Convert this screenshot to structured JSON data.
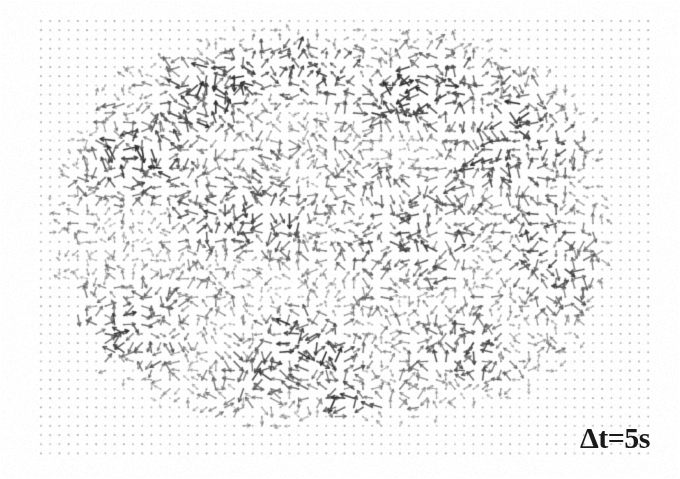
{
  "figure": {
    "kind": "piv-vector-field",
    "width": 680,
    "height": 479,
    "background_color": "#ffffff",
    "title": "",
    "caption": ""
  },
  "annotations": {
    "delta_t_label": "Δt=5s"
  },
  "chart_data": {
    "type": "scatter",
    "subtype": "quiver-vector-field",
    "title": "",
    "subtitle": "",
    "xlabel": "",
    "ylabel": "",
    "legend": [],
    "grid": true,
    "annotations": [
      {
        "text": "Δt=5s",
        "x": 605,
        "y": 438,
        "align": "right",
        "font_size": 30,
        "bold": true
      }
    ],
    "node_grid": {
      "x_start": 41,
      "y_start": 21,
      "spacing": 9.2,
      "cols": 67,
      "rows": 48,
      "node_color": "#8c8c8c",
      "node_size": 1.7
    },
    "vector_region": {
      "shape": "rounded-blob",
      "center_x": 332,
      "center_y": 226,
      "radius_x": 272,
      "radius_y": 196,
      "superellipse_exponent": 2.6,
      "edge_softness": 0.16
    },
    "vectors": {
      "arrow_color_dark": "#2e2e2e",
      "arrow_color_mid": "#6b6b6b",
      "arrow_color_light": "#aaaaaa",
      "min_length": 3.5,
      "max_length": 16,
      "head_size": 2.6,
      "line_width": 1.15,
      "coherence_scale": 52,
      "noise_seed": 20250411,
      "density": 1.0,
      "description": "Short velocity vectors emanating from each interior grid node, locally correlated in direction with strong small-scale disorder; intensity varies with local magnitude."
    },
    "intensity_patches": [
      {
        "cx": 290,
        "cy": 72,
        "rx": 120,
        "ry": 42,
        "weight": 0.95
      },
      {
        "cx": 432,
        "cy": 95,
        "rx": 110,
        "ry": 50,
        "weight": 0.92
      },
      {
        "cx": 520,
        "cy": 140,
        "rx": 85,
        "ry": 60,
        "weight": 0.85
      },
      {
        "cx": 150,
        "cy": 170,
        "rx": 75,
        "ry": 60,
        "weight": 0.8
      },
      {
        "cx": 240,
        "cy": 215,
        "rx": 90,
        "ry": 55,
        "weight": 0.72
      },
      {
        "cx": 400,
        "cy": 230,
        "rx": 100,
        "ry": 70,
        "weight": 0.6
      },
      {
        "cx": 545,
        "cy": 255,
        "rx": 60,
        "ry": 85,
        "weight": 0.7
      },
      {
        "cx": 130,
        "cy": 330,
        "rx": 80,
        "ry": 62,
        "weight": 0.68
      },
      {
        "cx": 300,
        "cy": 350,
        "rx": 95,
        "ry": 55,
        "weight": 0.62
      },
      {
        "cx": 355,
        "cy": 402,
        "rx": 40,
        "ry": 20,
        "weight": 1.0
      },
      {
        "cx": 470,
        "cy": 355,
        "rx": 70,
        "ry": 45,
        "weight": 0.66
      },
      {
        "cx": 200,
        "cy": 110,
        "rx": 60,
        "ry": 40,
        "weight": 0.78
      }
    ]
  }
}
